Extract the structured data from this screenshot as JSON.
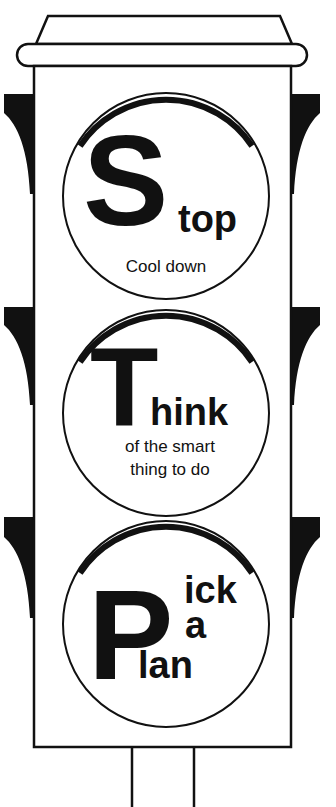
{
  "colors": {
    "ink": "#111111",
    "background": "#ffffff"
  },
  "lights": [
    {
      "position": "top",
      "big_letter": "S",
      "rest": "top",
      "subtitle_lines": [
        "Cool down"
      ]
    },
    {
      "position": "middle",
      "big_letter": "T",
      "rest": "hink",
      "subtitle_lines": [
        "of the smart",
        "thing to do"
      ]
    },
    {
      "position": "bottom",
      "big_letter": "P",
      "rest_lines": [
        "ick",
        "a",
        "lan"
      ]
    }
  ]
}
